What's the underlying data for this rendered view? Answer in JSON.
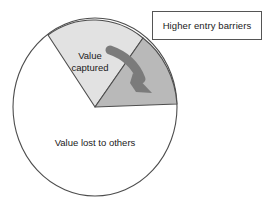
{
  "figure": {
    "type": "pie-diagram",
    "background_color": "#ffffff"
  },
  "callout": {
    "label": "Higher entry barriers",
    "border_color": "#555555",
    "fill_color": "#ffffff"
  },
  "pie": {
    "outline_color": "#4d4d4d",
    "center_x": 95,
    "center_y": 107,
    "radius_x": 82,
    "radius_y": 89,
    "slices": [
      {
        "name": "value-captured",
        "label_line_1": "Value",
        "label_line_2": "captured",
        "fill_color": "#e2e2e2",
        "start_angle_deg": 125,
        "end_angle_deg": 54
      },
      {
        "name": "higher-entry-barriers",
        "label": "",
        "fill_color": "#b9b9b9",
        "start_angle_deg": 54,
        "end_angle_deg": 2
      },
      {
        "name": "value-lost-to-others",
        "label": "Value lost to others",
        "fill_color": "#ffffff",
        "start_angle_deg": 2,
        "end_angle_deg": 125
      }
    ]
  },
  "arrow": {
    "name": "curved-arrow",
    "color": "#7b7b7b",
    "direction": "down-right",
    "points_to": "higher-entry-barriers"
  }
}
